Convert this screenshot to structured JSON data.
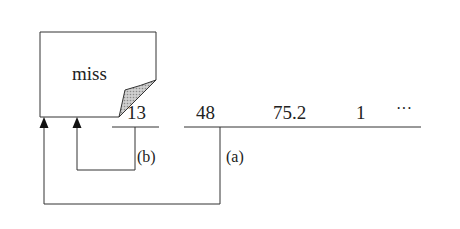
{
  "diagram": {
    "note": {
      "text": "miss"
    },
    "values": [
      {
        "text": "13",
        "x": 127
      },
      {
        "text": "48",
        "x": 196
      },
      {
        "text": "75.2",
        "x": 273
      },
      {
        "text": "1",
        "x": 356
      },
      {
        "text": "···",
        "x": 396
      }
    ],
    "refs": [
      {
        "text": "(b)",
        "x": 137,
        "y": 150
      },
      {
        "text": "(a)",
        "x": 226,
        "y": 150
      }
    ],
    "colors": {
      "line": "#333333",
      "curl_fill": "#b8b8b8"
    }
  }
}
